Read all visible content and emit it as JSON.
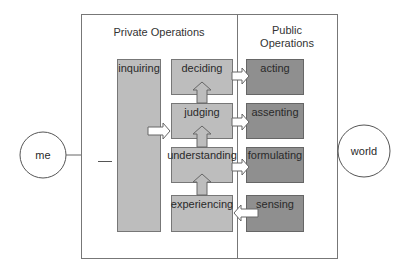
{
  "diagram": {
    "headers": {
      "private": "Private Operations",
      "public_line1": "Public",
      "public_line2": "Operations"
    },
    "entities": {
      "me": "me",
      "world": "world"
    },
    "private_left": {
      "inquiring": "inquiring"
    },
    "private_column": [
      {
        "id": "deciding",
        "label": "deciding"
      },
      {
        "id": "judging",
        "label": "judging"
      },
      {
        "id": "understanding",
        "label": "understanding"
      },
      {
        "id": "experiencing",
        "label": "experiencing"
      }
    ],
    "public_column": [
      {
        "id": "acting",
        "label": "acting"
      },
      {
        "id": "assenting",
        "label": "assenting"
      },
      {
        "id": "formulating",
        "label": "formulating"
      },
      {
        "id": "sensing",
        "label": "sensing"
      }
    ],
    "colors": {
      "private_box": "#bdbdbd",
      "public_box": "#8f8f8f",
      "border": "#666666",
      "arrow_fill": "#ffffff"
    }
  }
}
